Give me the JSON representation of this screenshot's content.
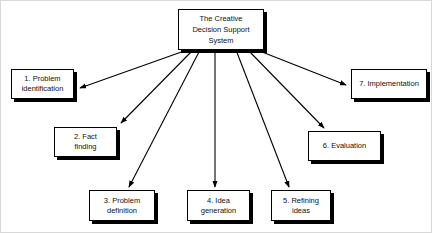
{
  "diagram": {
    "central": {
      "id": "central-node",
      "label": "The Creative\nDecision Support\nSystem"
    },
    "nodes": [
      {
        "id": "node-1",
        "number": "1.",
        "label": "1. Problem\nidentification"
      },
      {
        "id": "node-2",
        "number": "2.",
        "label": "2. Fact\nfinding"
      },
      {
        "id": "node-3",
        "number": "3.",
        "label": "3. Problem\ndefinition"
      },
      {
        "id": "node-4",
        "number": "4.",
        "label": "4. Idea\ngeneration"
      },
      {
        "id": "node-5",
        "number": "5.",
        "label": "5. Refining\nideas"
      },
      {
        "id": "node-6",
        "number": "6.",
        "label": "6. Evaluation"
      },
      {
        "id": "node-7",
        "number": "7.",
        "label": "7. Implementation"
      }
    ],
    "connectors": [
      {
        "id": "arrow-to-1",
        "from": "central-node",
        "to": "node-1"
      },
      {
        "id": "arrow-to-2",
        "from": "central-node",
        "to": "node-2"
      },
      {
        "id": "arrow-to-3",
        "from": "central-node",
        "to": "node-3"
      },
      {
        "id": "arrow-to-4",
        "from": "central-node",
        "to": "node-4"
      },
      {
        "id": "arrow-to-5",
        "from": "central-node",
        "to": "node-5"
      },
      {
        "id": "arrow-to-6",
        "from": "central-node",
        "to": "node-6"
      },
      {
        "id": "arrow-to-7",
        "from": "central-node",
        "to": "node-7"
      }
    ],
    "colors": {
      "background": "#ffffff",
      "box_fill": "#ffffff",
      "box_border": "#000000",
      "box_shadow": "#000000",
      "connector": "#000000",
      "text": "#111111",
      "frame": "#d8d8d8"
    }
  }
}
